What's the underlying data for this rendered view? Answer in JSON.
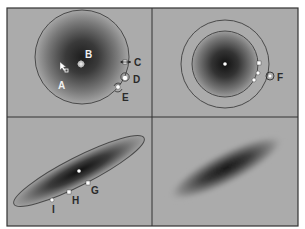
{
  "figure": {
    "colors": {
      "background": "#ababab",
      "frame": "#333333",
      "gradient_center": "#1a1a1a",
      "outline": "#4a4a4a",
      "handle_fill": "#ffffff"
    },
    "panels": [
      {
        "id": "top-left",
        "shape": "circle",
        "labels": [
          {
            "key": "A",
            "text": "A",
            "meaning": "move-cursor"
          },
          {
            "key": "B",
            "text": "B",
            "meaning": "center-point"
          },
          {
            "key": "C",
            "text": "C",
            "meaning": "resize-arrow-handle"
          },
          {
            "key": "D",
            "text": "D",
            "meaning": "circular-handle"
          },
          {
            "key": "E",
            "text": "E",
            "meaning": "rotate-handle"
          }
        ]
      },
      {
        "id": "top-right",
        "shape": "double-circle",
        "labels": [
          {
            "key": "F",
            "text": "F",
            "meaning": "outer-ring-handle"
          }
        ]
      },
      {
        "id": "bottom-left",
        "shape": "ellipse",
        "labels": [
          {
            "key": "G",
            "text": "G",
            "meaning": "handle"
          },
          {
            "key": "H",
            "text": "H",
            "meaning": "handle"
          },
          {
            "key": "I",
            "text": "I",
            "meaning": "handle"
          }
        ]
      },
      {
        "id": "bottom-right",
        "shape": "soft-ellipse",
        "labels": []
      }
    ]
  },
  "labels": {
    "A": "A",
    "B": "B",
    "C": "C",
    "D": "D",
    "E": "E",
    "F": "F",
    "G": "G",
    "H": "H",
    "I": "I"
  }
}
